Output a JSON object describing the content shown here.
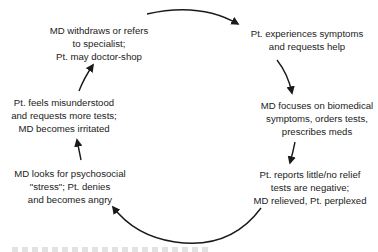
{
  "diagram": {
    "type": "cycle",
    "nodes": [
      {
        "id": "n1",
        "lines": [
          "Pt. experiences symptoms",
          "and requests help"
        ]
      },
      {
        "id": "n2",
        "lines": [
          "MD focuses on biomedical",
          "symptoms, orders tests,",
          "prescribes meds"
        ]
      },
      {
        "id": "n3",
        "lines": [
          "Pt. reports little/no relief",
          "tests are negative;",
          "MD relieved, Pt. perplexed"
        ]
      },
      {
        "id": "n4",
        "lines": [
          "MD looks for psychosocial",
          "\"stress\"; Pt. denies",
          "and becomes angry"
        ]
      },
      {
        "id": "n5",
        "lines": [
          "Pt. feels misunderstood",
          "and requests more tests;",
          "MD becomes irritated"
        ]
      },
      {
        "id": "n6",
        "lines": [
          "MD withdraws or refers",
          "to specialist;",
          "Pt. may doctor-shop"
        ]
      }
    ],
    "edges": [
      {
        "from": "n6",
        "to": "n1"
      },
      {
        "from": "n1",
        "to": "n2"
      },
      {
        "from": "n2",
        "to": "n3"
      },
      {
        "from": "n3",
        "to": "n4"
      },
      {
        "from": "n4",
        "to": "n5"
      },
      {
        "from": "n5",
        "to": "n6"
      }
    ],
    "colors": {
      "text": "#222222",
      "arrow": "#1a1a1a",
      "background": "#ffffff"
    }
  }
}
